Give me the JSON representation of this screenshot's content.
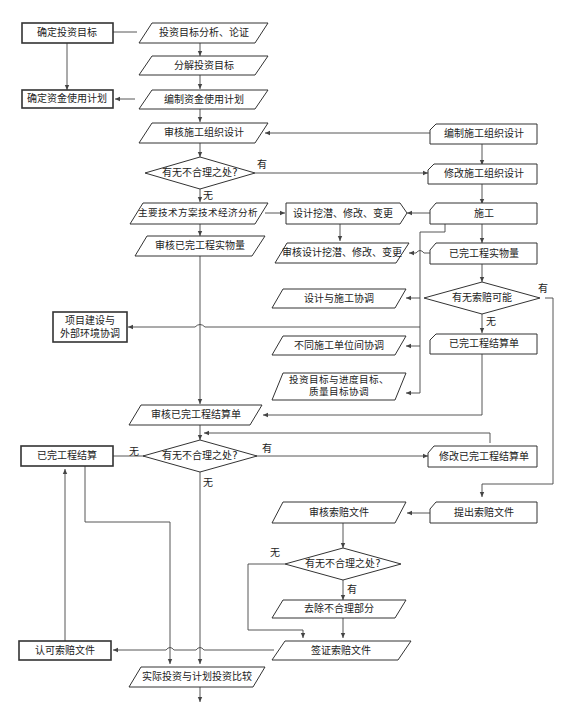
{
  "diagram": {
    "type": "flowchart",
    "nodes": {
      "n01": {
        "label": "确定投资目标",
        "shape": "rect"
      },
      "n02": {
        "label": "投资目标分析、论证",
        "shape": "parallelogram"
      },
      "n03": {
        "label": "分解投资目标",
        "shape": "parallelogram"
      },
      "n04": {
        "label": "确定资金使用计划",
        "shape": "rect"
      },
      "n05": {
        "label": "编制资金使用计划",
        "shape": "parallelogram"
      },
      "n06": {
        "label": "审核施工组织设计",
        "shape": "parallelogram"
      },
      "n07": {
        "label": "编制施工组织设计",
        "shape": "card"
      },
      "n08": {
        "label": "有无不合理之处?",
        "shape": "diamond"
      },
      "n09": {
        "label": "修改施工组织设计",
        "shape": "card"
      },
      "n10": {
        "label": "主要技术方案技术经济分析",
        "shape": "parallelogram"
      },
      "n11": {
        "label": "设计挖潜、修改、变更",
        "shape": "pentagon"
      },
      "n12": {
        "label": "施工",
        "shape": "card"
      },
      "n13": {
        "label": "审核已完工程实物量",
        "shape": "parallelogram"
      },
      "n14": {
        "label": "审核设计挖潜、修改、变更",
        "shape": "parallelogram"
      },
      "n15": {
        "label": "已完工程实物量",
        "shape": "card"
      },
      "n16": {
        "label": "设计与施工协调",
        "shape": "parallelogram"
      },
      "n17": {
        "label": "有无索赔可能",
        "shape": "diamond"
      },
      "n18_line1": {
        "label": "项目建设与"
      },
      "n18_line2": {
        "label": "外部环境协调"
      },
      "n19": {
        "label": "不同施工单位间协调",
        "shape": "parallelogram"
      },
      "n20": {
        "label": "已完工程结算单",
        "shape": "card"
      },
      "n21_line1": {
        "label": "投资目标与进度目标、"
      },
      "n21_line2": {
        "label": "质量目标协调"
      },
      "n22": {
        "label": "审核已完工程结算单",
        "shape": "parallelogram"
      },
      "n23": {
        "label": "已完工程结算",
        "shape": "rect"
      },
      "n24": {
        "label": "有无不合理之处?",
        "shape": "diamond"
      },
      "n25": {
        "label": "修改已完工程结算单",
        "shape": "card"
      },
      "n26": {
        "label": "审核索赔文件",
        "shape": "parallelogram"
      },
      "n27": {
        "label": "提出索赔文件",
        "shape": "card"
      },
      "n28": {
        "label": "有无不合理之处?",
        "shape": "diamond"
      },
      "n29": {
        "label": "去除不合理部分",
        "shape": "parallelogram"
      },
      "n30": {
        "label": "认可索赔文件",
        "shape": "rect"
      },
      "n31": {
        "label": "签证索赔文件",
        "shape": "parallelogram"
      },
      "n32": {
        "label": "实际投资与计划投资比较",
        "shape": "parallelogram"
      }
    },
    "edge_labels": {
      "d1_yes": "有",
      "d1_no": "无",
      "d2_yes": "有",
      "d2_no": "无",
      "d3_no_left": "无",
      "d3_yes_right": "有",
      "d3_no_down": "无",
      "d4_no": "无",
      "d4_yes": "有"
    }
  }
}
